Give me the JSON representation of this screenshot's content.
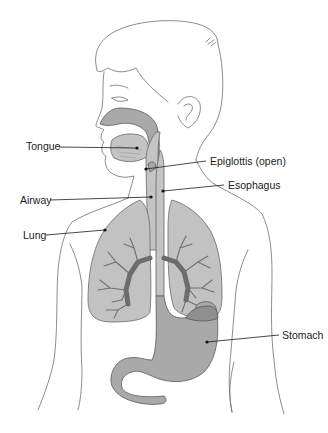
{
  "diagram": {
    "colors": {
      "organ_fill": "#a9a9a9",
      "lung_fill": "#c2c2c2",
      "line": "#6e6e6e",
      "label_text": "#222222"
    },
    "labels": [
      {
        "id": "tongue",
        "text": "Tongue"
      },
      {
        "id": "epiglottis",
        "text": "Epiglottis (open)"
      },
      {
        "id": "esophagus",
        "text": "Esophagus"
      },
      {
        "id": "airway",
        "text": "Airway"
      },
      {
        "id": "lung",
        "text": "Lung"
      },
      {
        "id": "stomach",
        "text": "Stomach"
      }
    ]
  }
}
